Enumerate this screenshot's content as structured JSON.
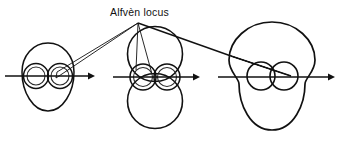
{
  "figure": {
    "title": "Alfvèn locus",
    "background_color": "#ffffff",
    "ink_color": "#111111",
    "width": 339,
    "height": 143,
    "panel_count": 3,
    "panels": [
      {
        "name": "left-panel",
        "description": "Small egg-shaped outer locus enclosing a figure-eight of two small circles, crossed by a horizontal propagation axis with rightward arrow.",
        "axis": {
          "x1": 5,
          "y1": 76,
          "x2": 92,
          "y2": 76,
          "arrow": "right"
        },
        "outer_shape": {
          "type": "egg",
          "cx": 48,
          "cy": 77,
          "rx": 26,
          "ry": 34
        },
        "inner_circles": [
          {
            "cx": 36,
            "cy": 76,
            "r": 12
          },
          {
            "cx": 60,
            "cy": 76,
            "r": 12
          },
          {
            "cx": 36,
            "cy": 76,
            "r": 9
          },
          {
            "cx": 60,
            "cy": 76,
            "r": 9
          }
        ]
      },
      {
        "name": "middle-panel",
        "description": "Two large circles tangent above and below the axis, with a figure-eight pair of small circles straddling the axis at the tangency point, crossed by a horizontal propagation axis with rightward arrow.",
        "axis": {
          "x1": 113,
          "y1": 77,
          "x2": 198,
          "y2": 77,
          "arrow": "right"
        },
        "outer_circles": [
          {
            "cx": 155,
            "cy": 55,
            "r": 27
          },
          {
            "cx": 155,
            "cy": 100,
            "r": 27
          }
        ],
        "inner_circles": [
          {
            "cx": 143,
            "cy": 77,
            "r": 13
          },
          {
            "cx": 167,
            "cy": 77,
            "r": 13
          },
          {
            "cx": 143,
            "cy": 77,
            "r": 10
          },
          {
            "cx": 167,
            "cy": 77,
            "r": 10
          }
        ]
      },
      {
        "name": "right-panel",
        "description": "Large peanut-shaped outer locus enclosing a small figure-eight pair of circles, crossed by a horizontal propagation axis with rightward arrow.",
        "axis": {
          "x1": 218,
          "y1": 77,
          "x2": 333,
          "y2": 77,
          "arrow": "right"
        },
        "outer_shape": {
          "type": "peanut",
          "cx": 272,
          "cy": 76,
          "rx": 43,
          "ry": 55
        },
        "inner_circles": [
          {
            "cx": 262,
            "cy": 76,
            "r": 14
          },
          {
            "cx": 283,
            "cy": 76,
            "r": 14
          }
        ]
      }
    ],
    "label": {
      "text": "Alfvèn locus",
      "x": 110,
      "y": 16,
      "apex": {
        "x": 138,
        "y": 22
      },
      "leaders": [
        {
          "name": "leader-to-left-panel",
          "to_x": 57,
          "to_y": 73
        },
        {
          "name": "leader-to-left-panel-alt",
          "to_x": 58,
          "to_y": 76
        },
        {
          "name": "leader-to-middle-panel-left-lobe",
          "to_x": 134,
          "to_y": 70
        },
        {
          "name": "leader-to-middle-panel-right-lobe",
          "to_x": 150,
          "to_y": 74
        },
        {
          "name": "leader-to-right-panel-upper",
          "to_x": 231,
          "to_y": 56
        },
        {
          "name": "leader-to-right-panel-lobe-a",
          "to_x": 278,
          "to_y": 72
        },
        {
          "name": "leader-to-right-panel-lobe-b",
          "to_x": 290,
          "to_y": 75
        }
      ]
    }
  }
}
